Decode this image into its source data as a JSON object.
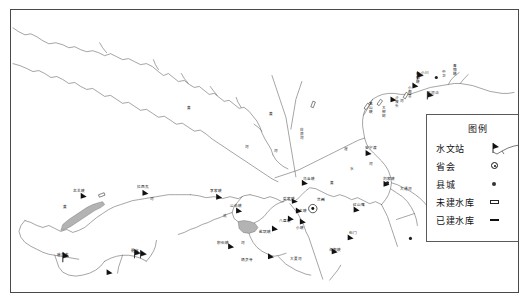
{
  "map": {
    "title": "黄河上游水系及水库分布图",
    "frame_color": "#4a4a4a",
    "background": "#ffffff",
    "river_color": "#555555",
    "reservoir_fill": "#a9a9a9"
  },
  "legend": {
    "title": "图例",
    "items": [
      {
        "label": "水文站",
        "symbol": "station-flag-icon"
      },
      {
        "label": "省会",
        "symbol": "capital-circle-icon"
      },
      {
        "label": "县城",
        "symbol": "county-dot-icon"
      },
      {
        "label": "未建水库",
        "symbol": "reservoir-open-icon"
      },
      {
        "label": "已建水库",
        "symbol": "reservoir-built-icon"
      }
    ]
  },
  "cities": [
    {
      "name": "兰州",
      "type": "province-capital",
      "x": 313,
      "y": 199
    }
  ],
  "rivers": [
    {
      "name": "黄",
      "x": 186,
      "y": 107
    },
    {
      "name": "河",
      "x": 244,
      "y": 146
    },
    {
      "name": "黄",
      "x": 268,
      "y": 113
    },
    {
      "name": "河",
      "x": 273,
      "y": 150
    },
    {
      "name": "河",
      "x": 368,
      "y": 163
    },
    {
      "name": "黄",
      "x": 329,
      "y": 182
    },
    {
      "name": "河",
      "x": 399,
      "y": 100
    },
    {
      "name": "黄",
      "x": 62,
      "y": 206
    },
    {
      "name": "河",
      "x": 149,
      "y": 198
    },
    {
      "name": "洮",
      "x": 222,
      "y": 215
    },
    {
      "name": "河",
      "x": 240,
      "y": 242
    },
    {
      "name": "大夏河",
      "x": 289,
      "y": 258
    },
    {
      "name": "湟",
      "x": 343,
      "y": 148
    },
    {
      "name": "水",
      "x": 349,
      "y": 168
    },
    {
      "name": "大通河",
      "x": 399,
      "y": 188
    },
    {
      "name": "庄浪河",
      "x": 296,
      "y": 132
    }
  ],
  "reservoirs": [
    {
      "name": "龙羊峡",
      "status": "built",
      "x": 81,
      "y": 190
    },
    {
      "name": "拉西瓦",
      "status": "planned",
      "x": 144,
      "y": 186
    },
    {
      "name": "李家峡",
      "status": "built",
      "x": 215,
      "y": 190
    },
    {
      "name": "公伯峡",
      "status": "built",
      "x": 235,
      "y": 204
    },
    {
      "name": "积石峡",
      "status": "built",
      "x": 225,
      "y": 240
    },
    {
      "name": "炳灵寺",
      "status": "planned",
      "x": 243,
      "y": 249
    },
    {
      "name": "刘家峡",
      "status": "built",
      "x": 383,
      "y": 178
    },
    {
      "name": "盐锅峡",
      "status": "built",
      "x": 272,
      "y": 223
    },
    {
      "name": "八盘峡",
      "status": "built",
      "x": 288,
      "y": 213
    },
    {
      "name": "大峡",
      "status": "built",
      "x": 296,
      "y": 206
    },
    {
      "name": "乌金峡",
      "status": "planned",
      "x": 301,
      "y": 177
    },
    {
      "name": "小峡",
      "status": "built",
      "x": 299,
      "y": 216
    },
    {
      "name": "柴家峡",
      "status": "planned",
      "x": 291,
      "y": 196
    },
    {
      "name": "沙坡头",
      "status": "built",
      "x": 392,
      "y": 92
    },
    {
      "name": "青铜峡",
      "status": "built",
      "x": 414,
      "y": 78
    },
    {
      "name": "大柳树",
      "status": "planned",
      "x": 383,
      "y": 101
    },
    {
      "name": "小观音",
      "status": "planned",
      "x": 406,
      "y": 88
    },
    {
      "name": "黑山峡",
      "status": "planned",
      "x": 374,
      "y": 98
    },
    {
      "name": "石门",
      "status": "planned",
      "x": 347,
      "y": 231
    },
    {
      "name": "海甸峡",
      "status": "planned",
      "x": 331,
      "y": 245
    },
    {
      "name": "安宁渡",
      "status": "planned",
      "x": 365,
      "y": 146
    },
    {
      "name": "红山嘴",
      "status": "planned",
      "x": 352,
      "y": 203
    }
  ],
  "stations": [
    {
      "name": "唐乃亥",
      "x": 60,
      "y": 252
    },
    {
      "name": "循化",
      "x": 131,
      "y": 248
    },
    {
      "name": "小川",
      "x": 420,
      "y": 70
    },
    {
      "name": "下河沿",
      "x": 430,
      "y": 88
    }
  ],
  "county_towns": [
    {
      "name": "中卫",
      "x": 437,
      "y": 68
    },
    {
      "name": "青铜峡",
      "x": 441,
      "y": 62
    }
  ]
}
